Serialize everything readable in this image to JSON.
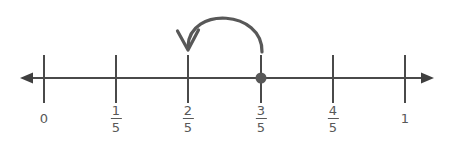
{
  "figure": {
    "type": "number-line",
    "title": "",
    "background_color": "#ffffff",
    "line_color": "#4a4a4a",
    "arc_color": "#585858",
    "point_color": "#585858",
    "label_color": "#585858"
  },
  "number_line": {
    "axis_y": 78,
    "axis_start_x": 20,
    "axis_end_x": 434,
    "left_arrow": "left-arrowhead",
    "right_arrow": "right-arrowhead",
    "tick_top_y": 55,
    "tick_bottom_y": 103,
    "ticks": [
      {
        "label": "0",
        "kind": "whole",
        "numerator": "",
        "denominator": "",
        "x": 44,
        "value": 0
      },
      {
        "label": "1/5",
        "kind": "fraction",
        "numerator": "1",
        "denominator": "5",
        "x": 116,
        "value": 0.2
      },
      {
        "label": "2/5",
        "kind": "fraction",
        "numerator": "2",
        "denominator": "5",
        "x": 188,
        "value": 0.4
      },
      {
        "label": "3/5",
        "kind": "fraction",
        "numerator": "3",
        "denominator": "5",
        "x": 261,
        "value": 0.6
      },
      {
        "label": "4/5",
        "kind": "fraction",
        "numerator": "4",
        "denominator": "5",
        "x": 333,
        "value": 0.8
      },
      {
        "label": "1",
        "kind": "whole",
        "numerator": "",
        "denominator": "",
        "x": 405,
        "value": 1
      }
    ]
  },
  "plotted_point": {
    "name": "point-at-three-fifths",
    "label": "3/5",
    "value": 0.6,
    "x": 261,
    "y": 78,
    "radius": 5.5
  },
  "jump_arrow": {
    "name": "jump-arrow-three-fifths-to-two-fifths",
    "from_label": "3/5",
    "to_label": "2/5",
    "from_x": 262,
    "to_x": 188,
    "direction": "leftward",
    "apex_y": 11,
    "start_y": 52,
    "end_y": 50,
    "path": "M 262 52 C 262 8 188 6 188 48",
    "arrowhead": "M 177 33 L 188 50 L 199 32"
  }
}
